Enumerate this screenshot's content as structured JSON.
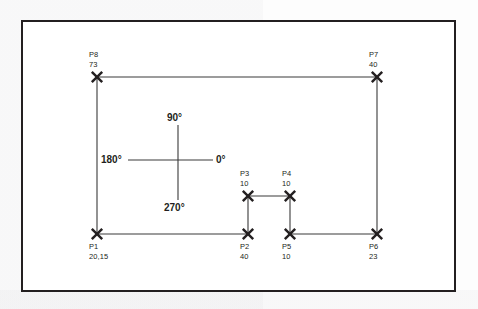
{
  "diagram": {
    "frame": {
      "stroke": "#231f20"
    },
    "line_color": "#3a3a3a",
    "marker_color": "#231f20",
    "points": [
      {
        "id": "P1",
        "value": "20,15",
        "x": 97,
        "y": 234,
        "label_pos": "below"
      },
      {
        "id": "P2",
        "value": "40",
        "x": 248,
        "y": 234,
        "label_pos": "below"
      },
      {
        "id": "P3",
        "value": "10",
        "x": 248,
        "y": 196,
        "label_pos": "above"
      },
      {
        "id": "P4",
        "value": "10",
        "x": 290,
        "y": 196,
        "label_pos": "above"
      },
      {
        "id": "P5",
        "value": "10",
        "x": 290,
        "y": 234,
        "label_pos": "below"
      },
      {
        "id": "P6",
        "value": "23",
        "x": 377,
        "y": 234,
        "label_pos": "below"
      },
      {
        "id": "P7",
        "value": "40",
        "x": 377,
        "y": 77,
        "label_pos": "above"
      },
      {
        "id": "P8",
        "value": "73",
        "x": 97,
        "y": 77,
        "label_pos": "above"
      }
    ],
    "segments": [
      {
        "from": "P8",
        "to": "P7"
      },
      {
        "from": "P8",
        "to": "P1"
      },
      {
        "from": "P1",
        "to": "P2"
      },
      {
        "from": "P2",
        "to": "P3"
      },
      {
        "from": "P3",
        "to": "P4"
      },
      {
        "from": "P4",
        "to": "P5"
      },
      {
        "from": "P5",
        "to": "P6"
      },
      {
        "from": "P6",
        "to": "P7"
      }
    ],
    "angle_compass": {
      "center_x": 178,
      "center_y": 160,
      "arm_left_x": 128,
      "arm_right_x": 213,
      "arm_top_y": 125,
      "arm_bottom_y": 200,
      "labels": {
        "top": "90°",
        "right": "0°",
        "bottom": "270°",
        "left": "180°"
      }
    }
  }
}
